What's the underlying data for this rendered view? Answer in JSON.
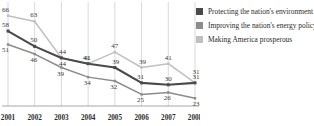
{
  "chart_data": {
    "type": "line",
    "title": "",
    "xlabel": "",
    "ylabel": "",
    "categories": [
      "2001",
      "2002",
      "2003",
      "2004",
      "2005",
      "2006",
      "2007",
      "2008"
    ],
    "ylim": [
      20,
      70
    ],
    "grid": true,
    "legend_position": "right",
    "series": [
      {
        "name": "Protecting the nation's environment",
        "color": "#4a4a4a",
        "values": [
          58,
          50,
          44,
          41,
          39,
          31,
          30,
          31
        ]
      },
      {
        "name": "Improving the nation's energy policy",
        "color": "#8c8c8c",
        "values": [
          51,
          46,
          39,
          34,
          32,
          25,
          26,
          23
        ]
      },
      {
        "name": "Making America prosperous",
        "color": "#c0c0c0",
        "values": [
          66,
          63,
          44,
          41,
          47,
          39,
          41,
          31
        ]
      }
    ]
  },
  "legend": {
    "items": [
      {
        "label": "Protecting the nation's environment",
        "color": "#4a4a4a"
      },
      {
        "label": "Improving the nation's energy policy",
        "color": "#8c8c8c"
      },
      {
        "label": "Making America prosperous",
        "color": "#c0c0c0"
      }
    ]
  }
}
